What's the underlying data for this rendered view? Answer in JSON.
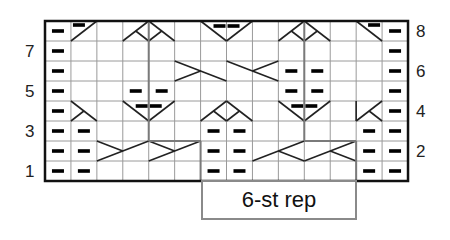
{
  "chart": {
    "columns": 14,
    "rows": 8,
    "grid": {
      "left": 45,
      "top": 21,
      "cell_width": 25.93,
      "cell_height": 20
    },
    "colors": {
      "grid": "#9a9a9a",
      "border": "#111111",
      "symbol": "#222222",
      "repeat_outline": "#7a7a7a"
    },
    "row_labels_left": [
      {
        "row": 7,
        "label": "7"
      },
      {
        "row": 5,
        "label": "5"
      },
      {
        "row": 3,
        "label": "3"
      },
      {
        "row": 1,
        "label": "1"
      }
    ],
    "row_labels_right": [
      {
        "row": 8,
        "label": "8"
      },
      {
        "row": 6,
        "label": "6"
      },
      {
        "row": 4,
        "label": "4"
      },
      {
        "row": 2,
        "label": "2"
      }
    ],
    "repeat": {
      "label": "6-st rep",
      "start_col": 6,
      "end_col": 11
    },
    "legend_symbols": {
      "purl": "purl-dash",
      "cable": "cross-lines"
    },
    "purls": [
      {
        "row": 8,
        "cols": [
          0,
          13
        ]
      },
      {
        "row": 7,
        "cols": [
          0,
          13
        ]
      },
      {
        "row": 6,
        "cols": [
          0,
          9,
          10,
          13
        ]
      },
      {
        "row": 5,
        "cols": [
          0,
          3,
          4,
          9,
          10,
          13
        ]
      },
      {
        "row": 4,
        "cols": [
          0,
          13
        ]
      },
      {
        "row": 3,
        "cols": [
          0,
          1,
          6,
          7,
          12,
          13
        ]
      },
      {
        "row": 2,
        "cols": [
          0,
          1,
          6,
          7,
          12,
          13
        ]
      },
      {
        "row": 1,
        "cols": [
          0,
          1,
          6,
          7,
          12,
          13
        ]
      }
    ]
  }
}
